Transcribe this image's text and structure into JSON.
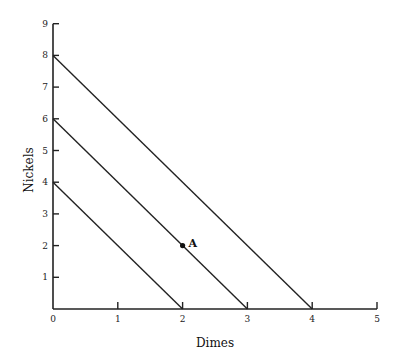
{
  "chart_data": {
    "type": "line",
    "title": "",
    "xlabel": "Dimes",
    "ylabel": "Nickels",
    "xlim": [
      0,
      5
    ],
    "ylim": [
      0,
      9
    ],
    "x_ticks": [
      "0",
      "1",
      "2",
      "3",
      "4",
      "5"
    ],
    "y_ticks": [
      "1",
      "2",
      "3",
      "4",
      "5",
      "6",
      "7",
      "8",
      "9"
    ],
    "grid": false,
    "legend": null,
    "series": [
      {
        "name": "line-1",
        "x": [
          0,
          2
        ],
        "y": [
          4,
          0
        ]
      },
      {
        "name": "line-2",
        "x": [
          0,
          3
        ],
        "y": [
          6,
          0
        ]
      },
      {
        "name": "line-3",
        "x": [
          0,
          4
        ],
        "y": [
          8,
          0
        ]
      }
    ],
    "annotations": [
      {
        "label": "A",
        "x": 2,
        "y": 2,
        "marker": "dot"
      }
    ]
  }
}
